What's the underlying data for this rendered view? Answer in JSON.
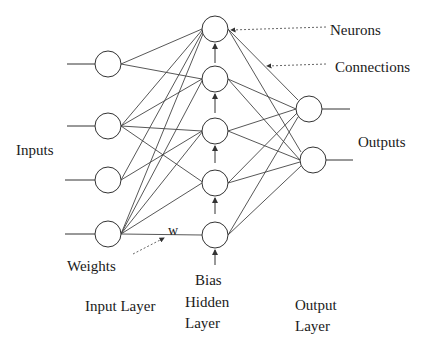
{
  "diagram": {
    "labels": {
      "neurons": "Neurons",
      "connections": "Connections",
      "inputs": "Inputs",
      "outputs": "Outputs",
      "weights": "Weights",
      "w": "w",
      "bias": "Bias",
      "input_layer": "Input Layer",
      "hidden_layer_1": "Hidden",
      "hidden_layer_2": "Layer",
      "output_layer_1": "Output",
      "output_layer_2": "Layer"
    },
    "layers": {
      "input": {
        "count": 4,
        "x": 108,
        "ys": [
          64,
          126,
          180,
          234
        ]
      },
      "hidden": {
        "count": 5,
        "x": 215,
        "ys": [
          29,
          79,
          131,
          183,
          235
        ]
      },
      "output": {
        "count": 2,
        "xs": [
          309,
          313
        ],
        "ys": [
          109,
          160
        ]
      }
    },
    "node_radius": 13,
    "stroke_color": "#333333"
  }
}
